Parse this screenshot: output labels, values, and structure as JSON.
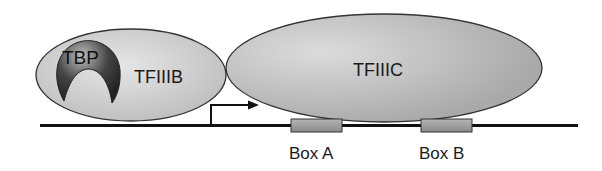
{
  "diagram": {
    "proteins": {
      "tbp": {
        "label": "TBP"
      },
      "tfiiib": {
        "label": "TFIIIB"
      },
      "tfiiic": {
        "label": "TFIIIC"
      }
    },
    "dna": {
      "elements": [
        {
          "label": "Box A"
        },
        {
          "label": "Box B"
        }
      ],
      "transcription_start": "arrow"
    },
    "colors": {
      "protein_fill": "#c8c8c8",
      "tbp_fill": "#3a3a3a",
      "box_fill": "#9a9a9a",
      "line": "#111111"
    }
  }
}
